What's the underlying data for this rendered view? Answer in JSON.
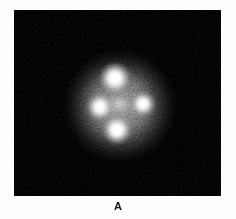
{
  "figure": {
    "caption_label": "A",
    "panel_background": "#000000",
    "page_background": "#ffffff",
    "alt_description": "Monochrome astronomical image: four bright point sources arranged in a cross around a faint central source, embedded in a speckled grainy halo on a black background."
  },
  "panel": {
    "name": "astronomical-image-panel",
    "x": 14,
    "y": 10,
    "width": 207,
    "height": 186
  },
  "chart_data": {
    "type": "scatter",
    "title": "",
    "subtitle": "",
    "xlabel": "",
    "ylabel": "",
    "xlim": [
      0,
      207
    ],
    "ylim": [
      0,
      186
    ],
    "grid": false,
    "legend": "none",
    "colormap": "grayscale",
    "background": "#000000",
    "annotations": [
      "A"
    ],
    "series": [
      {
        "name": "lensed-images",
        "points": [
          {
            "id": "image-a-top",
            "label": "A",
            "x": 101,
            "y": 68,
            "radius": 7.0,
            "peak_brightness": 255
          },
          {
            "id": "image-b-left",
            "label": "B",
            "x": 86,
            "y": 97,
            "radius": 6.0,
            "peak_brightness": 244
          },
          {
            "id": "image-c-right",
            "label": "C",
            "x": 129,
            "y": 94,
            "radius": 5.5,
            "peak_brightness": 238
          },
          {
            "id": "image-d-bottom",
            "label": "D",
            "x": 103,
            "y": 120,
            "radius": 6.5,
            "peak_brightness": 248
          }
        ]
      },
      {
        "name": "lens-galaxy",
        "points": [
          {
            "id": "central-source",
            "label": "G",
            "x": 105,
            "y": 94,
            "radius": 5.5,
            "peak_brightness": 200
          }
        ]
      }
    ],
    "halo": {
      "center_x": 106,
      "center_y": 96,
      "outer_radius": 54,
      "inner_radius": 37,
      "texture": "speckle"
    }
  }
}
